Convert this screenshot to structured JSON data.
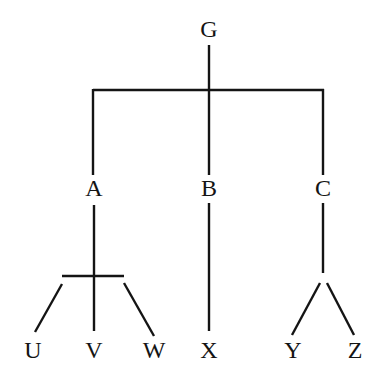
{
  "diagram": {
    "type": "tree",
    "root": "G",
    "nodes": [
      {
        "id": "G",
        "label": "G",
        "x": 209,
        "y": 30
      },
      {
        "id": "A",
        "label": "A",
        "x": 94,
        "y": 189
      },
      {
        "id": "B",
        "label": "B",
        "x": 209,
        "y": 189
      },
      {
        "id": "C",
        "label": "C",
        "x": 323,
        "y": 189
      },
      {
        "id": "U",
        "label": "U",
        "x": 33,
        "y": 351
      },
      {
        "id": "V",
        "label": "V",
        "x": 94,
        "y": 351
      },
      {
        "id": "W",
        "label": "W",
        "x": 154,
        "y": 351
      },
      {
        "id": "X",
        "label": "X",
        "x": 209,
        "y": 351
      },
      {
        "id": "Y",
        "label": "Y",
        "x": 293,
        "y": 351
      },
      {
        "id": "Z",
        "label": "Z",
        "x": 355,
        "y": 351
      }
    ],
    "edges": [
      {
        "from": "G",
        "to": "A"
      },
      {
        "from": "G",
        "to": "B"
      },
      {
        "from": "G",
        "to": "C"
      },
      {
        "from": "A",
        "to": "U"
      },
      {
        "from": "A",
        "to": "V"
      },
      {
        "from": "A",
        "to": "W"
      },
      {
        "from": "B",
        "to": "X"
      },
      {
        "from": "C",
        "to": "Y"
      },
      {
        "from": "C",
        "to": "Z"
      }
    ],
    "line_color": "#141414",
    "background": "#ffffff"
  }
}
